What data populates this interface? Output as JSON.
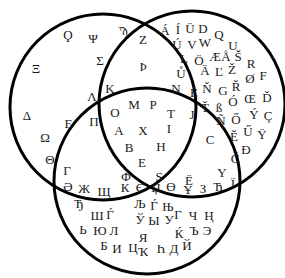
{
  "diagram": {
    "type": "venn",
    "sets": 3,
    "stroke_color": "#000000",
    "stroke_width": 3,
    "circles": [
      {
        "name": "left",
        "cx": 103,
        "cy": 107,
        "r": 93
      },
      {
        "name": "right",
        "cx": 192,
        "cy": 104,
        "r": 93
      },
      {
        "name": "bottom",
        "cx": 147,
        "cy": 181,
        "r": 93
      }
    ]
  },
  "regions": {
    "left_only": [
      {
        "c": "Ϙ",
        "x": 68,
        "y": 34
      },
      {
        "c": "Ψ",
        "x": 93,
        "y": 38
      },
      {
        "c": "Ϡ",
        "x": 123,
        "y": 30
      },
      {
        "c": "Σ",
        "x": 100,
        "y": 60
      },
      {
        "c": "Ξ",
        "x": 36,
        "y": 68
      },
      {
        "c": "Δ",
        "x": 27,
        "y": 115
      },
      {
        "c": "Ϝ",
        "x": 68,
        "y": 123
      },
      {
        "c": "Ω",
        "x": 45,
        "y": 137
      },
      {
        "c": "Θ",
        "x": 50,
        "y": 159
      }
    ],
    "right_only": [
      {
        "c": "Á",
        "x": 165,
        "y": 30
      },
      {
        "c": "Í",
        "x": 178,
        "y": 29
      },
      {
        "c": "Ü",
        "x": 190,
        "y": 28
      },
      {
        "c": "D",
        "x": 203,
        "y": 28
      },
      {
        "c": "Q",
        "x": 219,
        "y": 34
      },
      {
        "c": "Ú",
        "x": 177,
        "y": 44
      },
      {
        "c": "V",
        "x": 192,
        "y": 44
      },
      {
        "c": "W",
        "x": 205,
        "y": 42
      },
      {
        "c": "U",
        "x": 233,
        "y": 45
      },
      {
        "c": "L",
        "x": 184,
        "y": 58
      },
      {
        "c": "Ö",
        "x": 199,
        "y": 60
      },
      {
        "c": "Æ",
        "x": 215,
        "y": 56
      },
      {
        "c": "Å",
        "x": 226,
        "y": 56
      },
      {
        "c": "Š",
        "x": 238,
        "y": 56
      },
      {
        "c": "R",
        "x": 251,
        "y": 63
      },
      {
        "c": "Ů",
        "x": 181,
        "y": 73
      },
      {
        "c": "Ä",
        "x": 205,
        "y": 70
      },
      {
        "c": "Ľ",
        "x": 219,
        "y": 71
      },
      {
        "c": "Ž",
        "x": 232,
        "y": 69
      },
      {
        "c": "Ø",
        "x": 250,
        "y": 78
      },
      {
        "c": "F",
        "x": 263,
        "y": 75
      },
      {
        "c": "É",
        "x": 194,
        "y": 92
      },
      {
        "c": "Ň",
        "x": 207,
        "y": 88
      },
      {
        "c": "G",
        "x": 223,
        "y": 90
      },
      {
        "c": "Ř",
        "x": 236,
        "y": 86
      },
      {
        "c": "Ó",
        "x": 233,
        "y": 101
      },
      {
        "c": "Œ",
        "x": 250,
        "y": 98
      },
      {
        "c": "Ď",
        "x": 267,
        "y": 97
      },
      {
        "c": "Ť",
        "x": 205,
        "y": 107
      },
      {
        "c": "ß",
        "x": 219,
        "y": 107
      },
      {
        "c": "Ñ",
        "x": 221,
        "y": 120
      },
      {
        "c": "Ő",
        "x": 236,
        "y": 119
      },
      {
        "c": "Ý",
        "x": 254,
        "y": 114
      },
      {
        "c": "Ç",
        "x": 268,
        "y": 115
      },
      {
        "c": "Ĕ",
        "x": 234,
        "y": 136
      },
      {
        "c": "Ű",
        "x": 248,
        "y": 131
      },
      {
        "c": "Ÿ",
        "x": 262,
        "y": 134
      },
      {
        "c": "Đ",
        "x": 246,
        "y": 149
      },
      {
        "c": "Č",
        "x": 235,
        "y": 158
      }
    ],
    "bottom_only": [
      {
        "c": "Ə",
        "x": 68,
        "y": 186
      },
      {
        "c": "Ж",
        "x": 84,
        "y": 188
      },
      {
        "c": "Щ",
        "x": 104,
        "y": 191
      },
      {
        "c": "К",
        "x": 125,
        "y": 187
      },
      {
        "c": "Є",
        "x": 140,
        "y": 187
      },
      {
        "c": "Џ",
        "x": 156,
        "y": 187
      },
      {
        "c": "Ө",
        "x": 171,
        "y": 186
      },
      {
        "c": "Ұ",
        "x": 188,
        "y": 189
      },
      {
        "c": "З",
        "x": 203,
        "y": 188
      },
      {
        "c": "Ћ",
        "x": 218,
        "y": 186
      },
      {
        "c": "Ї",
        "x": 233,
        "y": 183
      },
      {
        "c": "Ђ",
        "x": 79,
        "y": 203
      },
      {
        "c": "Ш",
        "x": 97,
        "y": 215
      },
      {
        "c": "Ѓ",
        "x": 110,
        "y": 214
      },
      {
        "c": "Љ",
        "x": 140,
        "y": 203
      },
      {
        "c": "Ѓ",
        "x": 154,
        "y": 205
      },
      {
        "c": "Њ",
        "x": 168,
        "y": 206
      },
      {
        "c": "Г",
        "x": 178,
        "y": 214
      },
      {
        "c": "Ч",
        "x": 193,
        "y": 215
      },
      {
        "c": "Ң",
        "x": 209,
        "y": 215
      },
      {
        "c": "Ў",
        "x": 140,
        "y": 219
      },
      {
        "c": "Ы",
        "x": 154,
        "y": 220
      },
      {
        "c": "У",
        "x": 169,
        "y": 219
      },
      {
        "c": "Ь",
        "x": 83,
        "y": 229
      },
      {
        "c": "Ю",
        "x": 100,
        "y": 230
      },
      {
        "c": "Л",
        "x": 114,
        "y": 230
      },
      {
        "c": "Ќ",
        "x": 179,
        "y": 233
      },
      {
        "c": "Ъ",
        "x": 194,
        "y": 230
      },
      {
        "c": "Э",
        "x": 207,
        "y": 230
      },
      {
        "c": "Я",
        "x": 143,
        "y": 237
      },
      {
        "c": "Б",
        "x": 104,
        "y": 245
      },
      {
        "c": "И",
        "x": 117,
        "y": 248
      },
      {
        "c": "Ц",
        "x": 133,
        "y": 247
      },
      {
        "c": "Ҡ",
        "x": 143,
        "y": 251
      },
      {
        "c": "Һ",
        "x": 161,
        "y": 248
      },
      {
        "c": "Д",
        "x": 174,
        "y": 248
      },
      {
        "c": "Й",
        "x": 187,
        "y": 245
      }
    ],
    "left_right": [
      {
        "c": "Z",
        "x": 143,
        "y": 39
      },
      {
        "c": "Þ",
        "x": 143,
        "y": 66
      },
      {
        "c": "K",
        "x": 110,
        "y": 88
      }
    ],
    "left_bottom": [
      {
        "c": "Λ",
        "x": 92,
        "y": 96
      },
      {
        "c": "Π",
        "x": 94,
        "y": 121
      },
      {
        "c": "Γ",
        "x": 67,
        "y": 170
      }
    ],
    "right_bottom": [
      {
        "c": "N",
        "x": 176,
        "y": 88
      },
      {
        "c": "J",
        "x": 192,
        "y": 114
      },
      {
        "c": "C",
        "x": 210,
        "y": 139
      },
      {
        "c": "Y",
        "x": 222,
        "y": 172
      },
      {
        "c": "Ë",
        "x": 189,
        "y": 180
      }
    ],
    "all_three": [
      {
        "c": "O",
        "x": 115,
        "y": 112
      },
      {
        "c": "M",
        "x": 134,
        "y": 104
      },
      {
        "c": "P",
        "x": 153,
        "y": 104
      },
      {
        "c": "T",
        "x": 171,
        "y": 113
      },
      {
        "c": "A",
        "x": 119,
        "y": 130
      },
      {
        "c": "X",
        "x": 143,
        "y": 130
      },
      {
        "c": "I",
        "x": 169,
        "y": 128
      },
      {
        "c": "B",
        "x": 129,
        "y": 147
      },
      {
        "c": "H",
        "x": 161,
        "y": 146
      },
      {
        "c": "E",
        "x": 142,
        "y": 162
      }
    ],
    "boundary": [
      {
        "c": "Φ",
        "x": 126,
        "y": 176
      },
      {
        "c": "S",
        "x": 159,
        "y": 176
      }
    ]
  }
}
